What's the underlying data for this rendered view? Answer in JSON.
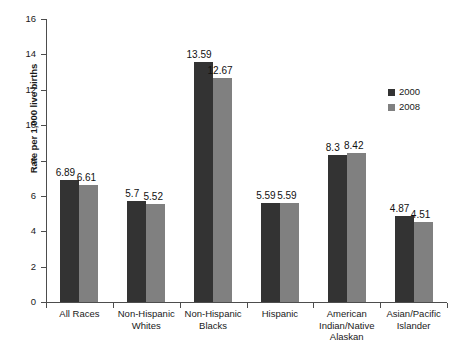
{
  "chart_data": {
    "type": "bar",
    "title": "",
    "xlabel": "",
    "ylabel": "Rate per 1,000 live births",
    "ylim": [
      0,
      16
    ],
    "yticks": [
      0,
      2,
      4,
      6,
      8,
      10,
      12,
      14,
      16
    ],
    "ytick_labels": [
      "0",
      "2",
      "4",
      "6",
      "8",
      "10",
      "12",
      "14",
      "16"
    ],
    "grid": false,
    "legend_position": "upper right",
    "categories": [
      "All Races",
      "Non-Hispanic\nWhites",
      "Non-Hispanic\nBlacks",
      "Hispanic",
      "American\nIndian/Native\nAlaskan",
      "Asian/Pacific\nIslander"
    ],
    "series": [
      {
        "name": "2000",
        "color": "#333333",
        "values": [
          6.89,
          5.7,
          13.59,
          5.59,
          8.3,
          4.87
        ],
        "labels": [
          "6.89",
          "5.7",
          "13.59",
          "5.59",
          "8.3",
          "4.87"
        ]
      },
      {
        "name": "2008",
        "color": "#808080",
        "values": [
          6.61,
          5.52,
          12.67,
          5.59,
          8.42,
          4.51
        ],
        "labels": [
          "6.61",
          "5.52",
          "12.67",
          "5.59",
          "8.42",
          "4.51"
        ]
      }
    ]
  },
  "legend": {
    "entries": [
      {
        "label": "2000",
        "color": "#333333"
      },
      {
        "label": "2008",
        "color": "#808080"
      }
    ]
  }
}
